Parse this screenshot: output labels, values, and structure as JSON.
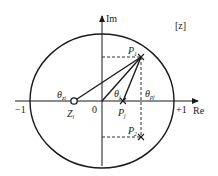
{
  "diagram": {
    "plane_label": "[z]",
    "axes": {
      "imag_label": "Im",
      "real_label": "Re",
      "origin_label": "0",
      "minus_one_label": "−1",
      "plus_one_label": "+1"
    },
    "points": {
      "zero": {
        "label": "Z",
        "sub": "i",
        "re": -0.38,
        "im": 0
      },
      "p1": {
        "label": "P",
        "sub": "1",
        "re": 0.54,
        "im": 0.66
      },
      "pj": {
        "label": "P",
        "sub": "j",
        "re": 0.29,
        "im": 0
      },
      "p2": {
        "label": "P",
        "sub": "2",
        "re": 0.54,
        "im": -0.54
      }
    },
    "angles": {
      "theta_zi": {
        "label": "θ",
        "sub": "zi"
      },
      "theta_j": {
        "label": "θ",
        "sub": "j"
      },
      "theta_pj": {
        "label": "θ",
        "sub": "pj"
      }
    },
    "colors": {
      "line": "#1a1a1a",
      "background": "#ffffff"
    }
  }
}
